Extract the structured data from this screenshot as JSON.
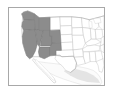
{
  "figure": {
    "kind": "thumbnail-map",
    "title": "",
    "caption": "",
    "width_px": 113,
    "height_px": 97
  },
  "frame": {
    "border_color": "#a8a8a8",
    "background_color": "#ffffff",
    "left_px": 8,
    "top_px": 7,
    "width_px": 97,
    "height_px": 79
  },
  "map": {
    "region": "Contiguous United States",
    "projection_hint": "equirectangular-approx",
    "colors": {
      "highlight_fill": "#8c8c8c",
      "highlight_stroke": "#6e6e6e",
      "state_fill": "#ffffff",
      "state_stroke": "#b4b4b4",
      "country_stroke": "#9a9a9a",
      "neighbor_fill": "#fbfbfb",
      "neighbor_stroke": "#cccccc",
      "water_fill": "#ffffff",
      "shadow_fill": "#e4e4e4"
    },
    "legend": {
      "visible": false,
      "highlight_label": "Highlighted states",
      "other_label": "Other states"
    },
    "highlighted_states": [
      "Washington",
      "Oregon",
      "California",
      "Idaho",
      "Nevada",
      "Utah",
      "Arizona",
      "New Mexico",
      "Colorado",
      "Wyoming"
    ],
    "unhighlighted_states": [
      "Montana",
      "North Dakota",
      "South Dakota",
      "Nebraska",
      "Kansas",
      "Oklahoma",
      "Texas",
      "Minnesota",
      "Iowa",
      "Missouri",
      "Arkansas",
      "Louisiana",
      "Wisconsin",
      "Illinois",
      "Michigan",
      "Indiana",
      "Ohio",
      "Kentucky",
      "Tennessee",
      "Mississippi",
      "Alabama",
      "Georgia",
      "Florida",
      "South Carolina",
      "North Carolina",
      "Virginia",
      "West Virginia",
      "Pennsylvania",
      "New York",
      "Maine"
    ],
    "neighbors": [
      "Mexico",
      "Baja California"
    ]
  },
  "chart_data": {
    "type": "map",
    "title": "",
    "xlabel": "",
    "ylabel": "",
    "categories": [
      "Washington",
      "Oregon",
      "California",
      "Idaho",
      "Nevada",
      "Utah",
      "Arizona",
      "New Mexico",
      "Colorado",
      "Wyoming",
      "Montana",
      "Texas",
      "Other states"
    ],
    "values": [
      1,
      1,
      1,
      1,
      1,
      1,
      1,
      1,
      1,
      1,
      0,
      0,
      0
    ],
    "value_labels": {
      "1": "highlighted",
      "0": "not highlighted"
    },
    "colorscale": [
      {
        "value": 0,
        "color": "#ffffff"
      },
      {
        "value": 1,
        "color": "#8c8c8c"
      }
    ],
    "legend_position": "none",
    "grid": false
  }
}
